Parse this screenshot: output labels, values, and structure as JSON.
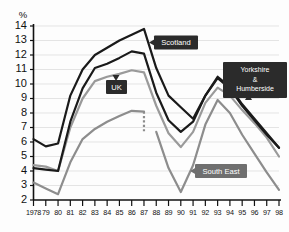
{
  "figure": {
    "unit_label": "%",
    "caption": ""
  },
  "chart_data": {
    "type": "line",
    "title": "",
    "xlabel": "",
    "ylabel": "%",
    "ylim": [
      2,
      14
    ],
    "xlim": [
      1978,
      1998
    ],
    "grid": true,
    "legend_position": "inline-callouts",
    "yticks": [
      2,
      3,
      4,
      5,
      6,
      7,
      8,
      9,
      10,
      11,
      12,
      13,
      14
    ],
    "ytick_labels": [
      "2",
      "3",
      "4",
      "5",
      "6",
      "7",
      "8",
      "9",
      "10",
      "11",
      "12",
      "13",
      "14"
    ],
    "x": [
      1978,
      1979,
      1980,
      1981,
      1982,
      1983,
      1984,
      1985,
      1986,
      1987,
      1988,
      1989,
      1990,
      1991,
      1992,
      1993,
      1994,
      1995,
      1996,
      1997,
      1998
    ],
    "xtick_labels": [
      "1978",
      "79",
      "80",
      "81",
      "82",
      "83",
      "84",
      "85",
      "86",
      "87",
      "88",
      "89",
      "90",
      "91",
      "92",
      "93",
      "94",
      "95",
      "96",
      "97",
      "98"
    ],
    "series": [
      {
        "name": "Scotland",
        "color": "#1a1a1a",
        "width": 2.2,
        "values": [
          6.2,
          5.7,
          5.9,
          9.2,
          11.0,
          12.0,
          12.5,
          13.0,
          13.4,
          13.8,
          11.1,
          9.2,
          8.4,
          7.6,
          9.2,
          10.5,
          9.8,
          8.6,
          7.6,
          6.6,
          5.6
        ]
      },
      {
        "name": "Yorkshire & Humberside",
        "color": "#1a1a1a",
        "width": 2.2,
        "values": [
          4.2,
          4.1,
          4.0,
          7.4,
          9.7,
          11.1,
          11.4,
          11.8,
          12.25,
          12.1,
          9.4,
          7.5,
          6.7,
          7.4,
          9.2,
          10.4,
          9.7,
          8.5,
          7.5,
          6.5,
          5.6
        ]
      },
      {
        "name": "UK",
        "color": "#9a9a9a",
        "width": 2.2,
        "values": [
          4.4,
          4.3,
          4.0,
          7.0,
          9.0,
          10.2,
          10.5,
          10.7,
          10.95,
          10.8,
          8.5,
          6.6,
          5.65,
          6.7,
          8.7,
          9.75,
          9.2,
          8.2,
          7.3,
          6.3,
          5.0
        ]
      },
      {
        "name": "South East",
        "color": "#8d8d8d",
        "width": 2.2,
        "values": [
          3.2,
          2.8,
          2.4,
          4.6,
          6.2,
          6.9,
          7.4,
          7.8,
          8.15,
          8.1,
          6.7,
          4.2,
          2.55,
          4.4,
          7.2,
          8.9,
          8.0,
          6.5,
          5.2,
          3.9,
          2.7
        ],
        "break_at_year": 1987,
        "break_note": "dashed vertical discontinuity at 1987 between 8.1 and 6.7"
      }
    ],
    "annotations": [
      {
        "label": "Scotland",
        "style": "dark",
        "target_year": 1987,
        "target_value": 13.5
      },
      {
        "label_lines": [
          "Yorkshire",
          "&",
          "Humberside"
        ],
        "style": "dark",
        "target_year": 1994,
        "target_value": 9.7
      },
      {
        "label": "UK",
        "style": "dark",
        "target_year": 1986,
        "target_value": 10.95
      },
      {
        "label": "South East",
        "style": "gray",
        "target_year": 1992,
        "target_value": 7.2
      }
    ]
  },
  "callouts": {
    "scotland": "Scotland",
    "yorkshire_line1": "Yorkshire",
    "yorkshire_line2": "&",
    "yorkshire_line3": "Humberside",
    "uk": "UK",
    "south_east": "South East"
  }
}
